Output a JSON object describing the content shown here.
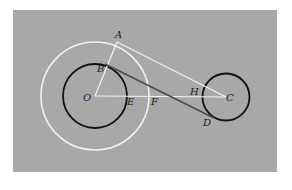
{
  "figure": {
    "colors": {
      "background_panel": "#a8a8a8",
      "page": "#ffffff",
      "white_lines": "#f2f2f2",
      "black_circles": "#111111",
      "dark_line": "#4d4d4d",
      "label": "#1a1a1a"
    },
    "points": {
      "O": {
        "label": "O",
        "x": 95,
        "y": 96
      },
      "A": {
        "label": "A",
        "x": 117,
        "y": 42
      },
      "B": {
        "label": "B",
        "x": 105,
        "y": 64
      },
      "C": {
        "label": "C",
        "x": 226,
        "y": 97
      },
      "D": {
        "label": "D",
        "x": 214,
        "y": 118
      },
      "E": {
        "label": "E",
        "x": 127,
        "y": 96
      },
      "F": {
        "label": "F",
        "x": 149,
        "y": 96
      },
      "H": {
        "label": "H",
        "x": 202,
        "y": 89
      }
    },
    "circles": [
      {
        "name": "inner-circle-O",
        "cx": 95,
        "cy": 96,
        "r": 32,
        "color": "black"
      },
      {
        "name": "outer-circle-O",
        "cx": 95,
        "cy": 96,
        "r": 54,
        "color": "white"
      },
      {
        "name": "circle-C",
        "cx": 226,
        "cy": 97,
        "r": 23.5,
        "color": "black"
      }
    ],
    "segments": [
      {
        "name": "segment-OA",
        "from": "O",
        "to": "A",
        "color": "white"
      },
      {
        "name": "segment-OC",
        "from": "O",
        "to": "C",
        "color": "white"
      },
      {
        "name": "segment-AC",
        "from": "A",
        "to": "C",
        "color": "white"
      },
      {
        "name": "segment-BD",
        "from": "B",
        "to": "D",
        "color": "dark"
      }
    ],
    "labels": [
      {
        "id": "A",
        "text": "A",
        "x": 115,
        "y": 38
      },
      {
        "id": "B",
        "text": "B",
        "x": 97,
        "y": 72
      },
      {
        "id": "O",
        "text": "O",
        "x": 83,
        "y": 101
      },
      {
        "id": "E",
        "text": "E",
        "x": 127,
        "y": 105
      },
      {
        "id": "F",
        "text": "F",
        "x": 151,
        "y": 105
      },
      {
        "id": "H",
        "text": "H",
        "x": 190,
        "y": 95
      },
      {
        "id": "C",
        "text": "C",
        "x": 226,
        "y": 101
      },
      {
        "id": "D",
        "text": "D",
        "x": 203,
        "y": 126
      }
    ]
  }
}
